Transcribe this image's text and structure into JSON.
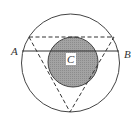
{
  "diagram": {
    "labels": {
      "A": "A",
      "B": "B",
      "C": "C"
    },
    "colors": {
      "stroke": "#444444",
      "fill_inner": "#9a9a9a",
      "background": "#ffffff"
    },
    "shapes": {
      "outer_circle": {
        "cx": 70.5,
        "cy": 63,
        "r": 49
      },
      "inner_circle": {
        "cx": 73,
        "cy": 62,
        "r": 25
      },
      "chord_AB": {
        "y": 51
      },
      "dashed_triangle": {
        "top_y": 37,
        "apex_x": 70,
        "apex_y": 112
      }
    }
  }
}
